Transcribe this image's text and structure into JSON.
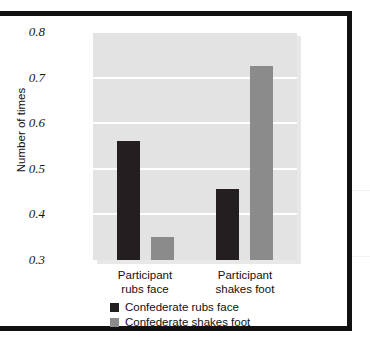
{
  "figure": {
    "background_color": "#ffffff",
    "border_color": "#111111",
    "plot_background_color": "#e3e3e3",
    "gridline_color": "#ffffff"
  },
  "chart_data": {
    "type": "bar",
    "title": "",
    "subtitle": "",
    "xlabel": "",
    "ylabel": "Number of times",
    "ylim": [
      0.3,
      0.8
    ],
    "yticks": [
      "0.3",
      "0.4",
      "0.5",
      "0.6",
      "0.7",
      "0.8"
    ],
    "ytick_values": [
      0.3,
      0.4,
      0.5,
      0.6,
      0.7,
      0.8
    ],
    "grid": true,
    "grid_axis": "y",
    "legend_position": "below-axes-left",
    "categories": [
      "Participant rubs face",
      "Participant shakes foot"
    ],
    "category_lines": [
      [
        "Participant",
        "rubs face"
      ],
      [
        "Participant",
        "shakes foot"
      ]
    ],
    "series": [
      {
        "name": "Confederate rubs face",
        "color": "#231f20",
        "values": [
          0.56,
          0.455
        ]
      },
      {
        "name": "Confederate shakes foot",
        "color": "#8b8b8b",
        "values": [
          0.35,
          0.725
        ]
      }
    ]
  },
  "legend": {
    "items": [
      {
        "label": "Confederate rubs face",
        "color": "#231f20"
      },
      {
        "label": "Confederate shakes foot",
        "color": "#8b8b8b"
      }
    ]
  }
}
